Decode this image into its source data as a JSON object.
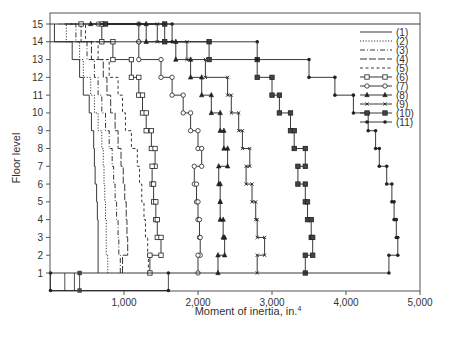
{
  "chart_data": {
    "type": "line",
    "title": "",
    "xlabel": "Moment of inertia, in.",
    "xlabel_superscript": "4",
    "ylabel": "Floor level",
    "xlim": [
      0,
      5000
    ],
    "ylim": [
      0,
      15
    ],
    "x_ticks": [
      1000,
      2000,
      3000,
      4000,
      5000
    ],
    "x_tick_labels": [
      "1,000",
      "2,000",
      "3,000",
      "4,000",
      "5,000"
    ],
    "y_ticks": [
      1,
      2,
      3,
      4,
      5,
      6,
      7,
      8,
      9,
      10,
      11,
      12,
      13,
      14,
      15
    ],
    "y_tick_labels": [
      "1",
      "2",
      "3",
      "4",
      "5",
      "6",
      "7",
      "8",
      "9",
      "10",
      "11",
      "12",
      "13",
      "14",
      "15"
    ],
    "grid": false,
    "legend_position": "upper right",
    "step_plot": true,
    "floors": [
      1,
      2,
      3,
      4,
      5,
      6,
      7,
      8,
      9,
      10,
      11,
      12,
      13,
      14,
      15
    ],
    "series": [
      {
        "name": "(1)",
        "style": "solid",
        "marker": "none",
        "values": [
          650,
          650,
          650,
          640,
          630,
          610,
          600,
          590,
          560,
          530,
          450,
          400,
          300,
          60,
          60
        ]
      },
      {
        "name": "(2)",
        "style": "dotted",
        "marker": "none",
        "values": [
          780,
          760,
          760,
          750,
          740,
          730,
          720,
          700,
          650,
          600,
          550,
          450,
          400,
          220,
          120
        ]
      },
      {
        "name": "(3)",
        "style": "dash-dot",
        "marker": "none",
        "values": [
          950,
          930,
          920,
          900,
          880,
          860,
          840,
          800,
          750,
          700,
          650,
          600,
          500,
          350,
          200
        ]
      },
      {
        "name": "(4)",
        "style": "long-dash",
        "marker": "none",
        "values": [
          980,
          1050,
          1040,
          1030,
          1010,
          990,
          960,
          920,
          880,
          820,
          770,
          720,
          560,
          420,
          250
        ]
      },
      {
        "name": "(5)",
        "style": "dashed",
        "marker": "none",
        "values": [
          1330,
          1320,
          1290,
          1270,
          1240,
          1210,
          1180,
          1100,
          1020,
          980,
          920,
          800,
          650,
          480,
          220
        ]
      },
      {
        "name": "(6)",
        "style": "solid",
        "marker": "square",
        "values": [
          1350,
          1500,
          1450,
          1430,
          1400,
          1380,
          1420,
          1370,
          1300,
          1250,
          1200,
          1100,
          850,
          700,
          420
        ]
      },
      {
        "name": "(7)",
        "style": "solid",
        "marker": "circle",
        "values": [
          2000,
          2030,
          2020,
          2000,
          1980,
          1950,
          2050,
          2000,
          1900,
          1800,
          1650,
          1500,
          1200,
          1200,
          650
        ]
      },
      {
        "name": "(8)",
        "style": "solid",
        "marker": "triangle",
        "values": [
          2270,
          2360,
          2340,
          2300,
          2300,
          2280,
          2400,
          2350,
          2300,
          2180,
          2050,
          1900,
          1700,
          1300,
          550
        ]
      },
      {
        "name": "(9)",
        "style": "solid",
        "marker": "x",
        "values": [
          2800,
          2900,
          2800,
          2780,
          2730,
          2650,
          2700,
          2600,
          2550,
          2450,
          2400,
          2100,
          1850,
          1450,
          700
        ]
      },
      {
        "name": "(10)",
        "style": "solid",
        "marker": "filled-square",
        "values": [
          3450,
          3550,
          3530,
          3480,
          3450,
          3350,
          3450,
          3300,
          3250,
          3100,
          3000,
          2800,
          2150,
          1550,
          750
        ]
      },
      {
        "name": "(11)",
        "style": "solid",
        "marker": "filled-circle",
        "values": [
          4580,
          4700,
          4680,
          4650,
          4620,
          4550,
          4450,
          4400,
          4300,
          4100,
          3850,
          3500,
          2800,
          1650,
          1200
        ]
      }
    ],
    "base_segments": {
      "floor_0_to_1_verticals_x": [
        0,
        200,
        330,
        400,
        1600
      ],
      "floor_1_connector_x_range": [
        0,
        5000
      ],
      "floor_0_connector_x_range": [
        0,
        1600
      ]
    }
  },
  "legend": {
    "items": [
      "(1)",
      "(2)",
      "(3)",
      "(4)",
      "(5)",
      "(6)",
      "(7)",
      "(8)",
      "(9)",
      "(10)",
      "(11)"
    ]
  }
}
